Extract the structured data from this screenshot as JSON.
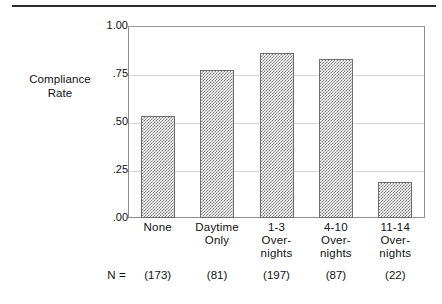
{
  "figure": {
    "y_axis_title_line1": "Compliance",
    "y_axis_title_line2": "Rate",
    "n_label": "N ="
  },
  "chart_data": {
    "type": "bar",
    "title": "",
    "xlabel": "",
    "ylabel": "Compliance Rate",
    "categories": [
      "None",
      "Daytime Only",
      "1-3 Overnights",
      "4-10 Overnights",
      "11-14 Overnights"
    ],
    "category_lines": [
      [
        "None"
      ],
      [
        "Daytime",
        "Only"
      ],
      [
        "1-3",
        "Over-",
        "nights"
      ],
      [
        "4-10",
        "Over-",
        "nights"
      ],
      [
        "11-14",
        "Over-",
        "nights"
      ]
    ],
    "values": [
      0.53,
      0.77,
      0.86,
      0.83,
      0.19
    ],
    "n_values": [
      "(173)",
      "(81)",
      "(197)",
      "(87)",
      "(22)"
    ],
    "ylim": [
      0.0,
      1.0
    ],
    "yticks": [
      1.0,
      0.75,
      0.5,
      0.25,
      0.0
    ],
    "ytick_labels": [
      "1.00",
      ".75",
      ".50",
      ".25",
      ".00"
    ],
    "grid": true,
    "legend": "none",
    "bar_fill": "#7d7d7d",
    "bar_edge": "#6e6e6e",
    "gridline_color": "#d6d6d6",
    "frame_color": "#8e8e8e"
  }
}
